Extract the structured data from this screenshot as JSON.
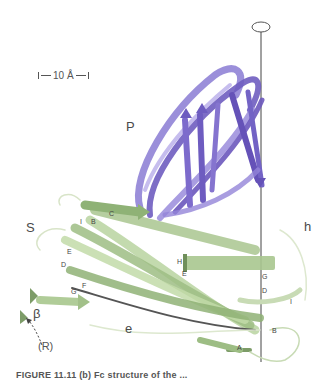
{
  "figure": {
    "scale_bar": {
      "label": "10 Å"
    },
    "domains": {
      "P": {
        "label": "P",
        "color": "#7b68c8"
      },
      "S": {
        "label": "S",
        "color": "#9fc08a"
      },
      "h": {
        "label": "h"
      },
      "e": {
        "label": "e"
      },
      "beta": {
        "label": "β"
      },
      "R": {
        "label": "(R)"
      }
    },
    "strand_labels": {
      "I_top": "I",
      "B_top": "B",
      "C": "C",
      "E_left": "E",
      "D_left": "D",
      "F": "F",
      "G_left": "G",
      "H": "H",
      "E_mid": "E",
      "G_right": "G",
      "D_right": "D",
      "I_right": "I",
      "B_bottom": "B",
      "A": "A"
    },
    "symmetry_axis": {
      "symbol": "two-fold axis (ellipse)"
    },
    "caption": "FIGURE 11.11 (b) Fc structure of the ..."
  }
}
